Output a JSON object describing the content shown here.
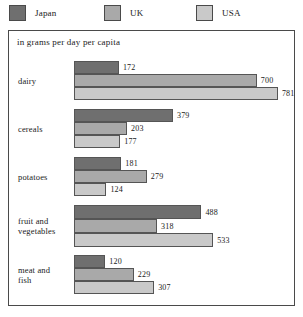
{
  "legend": {
    "items": [
      {
        "label": "Japan",
        "color": "#6f6f6f"
      },
      {
        "label": "UK",
        "color": "#a9a9a9"
      },
      {
        "label": "USA",
        "color": "#c9c9c9"
      }
    ]
  },
  "caption": "in grams per day per capita",
  "chart_data": {
    "type": "bar",
    "orientation": "horizontal",
    "title": "",
    "subtitle": "in grams per day per capita",
    "xlabel": "",
    "ylabel": "",
    "unit": "grams per day per capita",
    "grid": false,
    "legend_position": "top",
    "axis_visible": false,
    "xlim": [
      0,
      781
    ],
    "categories": [
      "dairy",
      "cereals",
      "potatoes",
      "fruit and vegetables",
      "meat and fish"
    ],
    "series": [
      {
        "name": "Japan",
        "color": "#6f6f6f",
        "values": [
          172,
          379,
          181,
          488,
          120
        ]
      },
      {
        "name": "UK",
        "color": "#a9a9a9",
        "values": [
          700,
          203,
          279,
          318,
          229
        ]
      },
      {
        "name": "USA",
        "color": "#c9c9c9",
        "values": [
          781,
          177,
          124,
          533,
          307
        ]
      }
    ],
    "groups": [
      {
        "category": "dairy",
        "label_lines": [
          "dairy"
        ],
        "bars": [
          {
            "series": "Japan",
            "value": 172,
            "value_label": "172"
          },
          {
            "series": "UK",
            "value": 700,
            "value_label": "700"
          },
          {
            "series": "USA",
            "value": 781,
            "value_label": "781"
          }
        ]
      },
      {
        "category": "cereals",
        "label_lines": [
          "cereals"
        ],
        "bars": [
          {
            "series": "Japan",
            "value": 379,
            "value_label": "379"
          },
          {
            "series": "UK",
            "value": 203,
            "value_label": "203"
          },
          {
            "series": "USA",
            "value": 177,
            "value_label": "177"
          }
        ]
      },
      {
        "category": "potatoes",
        "label_lines": [
          "potatoes"
        ],
        "bars": [
          {
            "series": "Japan",
            "value": 181,
            "value_label": "181"
          },
          {
            "series": "UK",
            "value": 279,
            "value_label": "279"
          },
          {
            "series": "USA",
            "value": 124,
            "value_label": "124"
          }
        ]
      },
      {
        "category": "fruit and vegetables",
        "label_lines": [
          "fruit and",
          "vegetables"
        ],
        "bars": [
          {
            "series": "Japan",
            "value": 488,
            "value_label": "488"
          },
          {
            "series": "UK",
            "value": 318,
            "value_label": "318"
          },
          {
            "series": "USA",
            "value": 533,
            "value_label": "533"
          }
        ]
      },
      {
        "category": "meat and fish",
        "label_lines": [
          "meat and",
          "fish"
        ],
        "bars": [
          {
            "series": "Japan",
            "value": 120,
            "value_label": "120"
          },
          {
            "series": "UK",
            "value": 229,
            "value_label": "229"
          },
          {
            "series": "USA",
            "value": 307,
            "value_label": "307"
          }
        ]
      }
    ]
  },
  "render": {
    "px_per_unit": 0.2611
  }
}
